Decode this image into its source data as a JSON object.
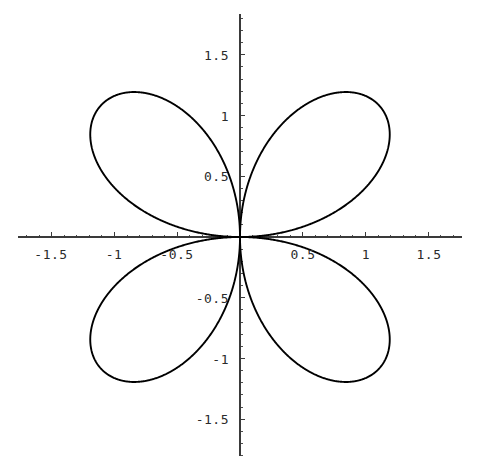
{
  "figure": {
    "name": "four-petal-rose-polar-plot",
    "background_color": "#ffffff",
    "curve_color": "#000000",
    "axis_color": "#3a3a3a",
    "label_color": "#2b2b2b",
    "width": 478,
    "height": 470
  },
  "axes": {
    "origin_px": {
      "x": 240,
      "y": 237
    },
    "px_per_unit_x": 125.5,
    "px_per_unit_y": 121.5,
    "x_axis_extent_px": {
      "start": 18,
      "end": 462
    },
    "y_axis_extent_px": {
      "start": 14,
      "end": 456
    },
    "major_tick_len": 5,
    "minor_tick_len": 2.5,
    "minor_ticks_per_major": 5
  },
  "chart_data": {
    "type": "line",
    "plot_kind": "polar-rose",
    "title": "",
    "xlabel": "",
    "ylabel": "",
    "grid": false,
    "legend": false,
    "legend_position": "none",
    "equation": "r = 1.55*cos(2*theta), rotated 45 degrees (four petals on diagonals)",
    "petal_count": 4,
    "max_radius": 1.55,
    "petal_axis_angles_deg": [
      45,
      135,
      225,
      315
    ],
    "xlim": [
      -1.77,
      1.77
    ],
    "ylim": [
      -1.83,
      1.83
    ],
    "x_ticks": [
      -1.5,
      -1,
      -0.5,
      0.5,
      1,
      1.5
    ],
    "x_tick_labels": [
      "-1.5",
      "-1",
      "-0.5",
      "0.5",
      "1",
      "1.5"
    ],
    "y_ticks": [
      1.5,
      1,
      0.5,
      -0.5,
      -1,
      -1.5
    ],
    "y_tick_labels": [
      "1.5",
      "1",
      "0.5",
      "-0.5",
      "-1",
      "-1.5"
    ],
    "x_minor_tick_step": 0.1,
    "y_minor_tick_step": 0.1,
    "petal_extremes": {
      "upper_right_tip": [
        1.1,
        1.1
      ],
      "upper_left_tip": [
        -1.1,
        1.1
      ],
      "lower_left_tip": [
        -1.1,
        -1.1
      ],
      "lower_right_tip": [
        1.1,
        -1.1
      ]
    },
    "bounding_extremes": {
      "max_x": 1.55,
      "min_x": -1.55,
      "max_y": 1.51,
      "min_y": -1.51
    },
    "series": [
      {
        "name": "rose",
        "theta_step_deg": 1,
        "r_of_theta": "1.55*|cos(2*(theta - 45deg))| on each petal arc"
      }
    ]
  },
  "x_tick_label_positions": [
    {
      "label": "-1.5",
      "px_x": 51,
      "px_y": 248
    },
    {
      "label": "-1",
      "px_x": 114,
      "px_y": 248
    },
    {
      "label": "-0.5",
      "px_x": 177,
      "px_y": 248
    },
    {
      "label": "0.5",
      "px_x": 303,
      "px_y": 248
    },
    {
      "label": "1",
      "px_x": 366,
      "px_y": 248
    },
    {
      "label": "1.5",
      "px_x": 429,
      "px_y": 248
    }
  ],
  "y_tick_label_positions": [
    {
      "label": "1.5",
      "px_x": 229,
      "px_y": 55
    },
    {
      "label": "1",
      "px_x": 229,
      "px_y": 116
    },
    {
      "label": "0.5",
      "px_x": 229,
      "px_y": 176
    },
    {
      "label": "-0.5",
      "px_x": 229,
      "px_y": 298
    },
    {
      "label": "-1",
      "px_x": 229,
      "px_y": 359
    },
    {
      "label": "-1.5",
      "px_x": 229,
      "px_y": 419
    }
  ]
}
